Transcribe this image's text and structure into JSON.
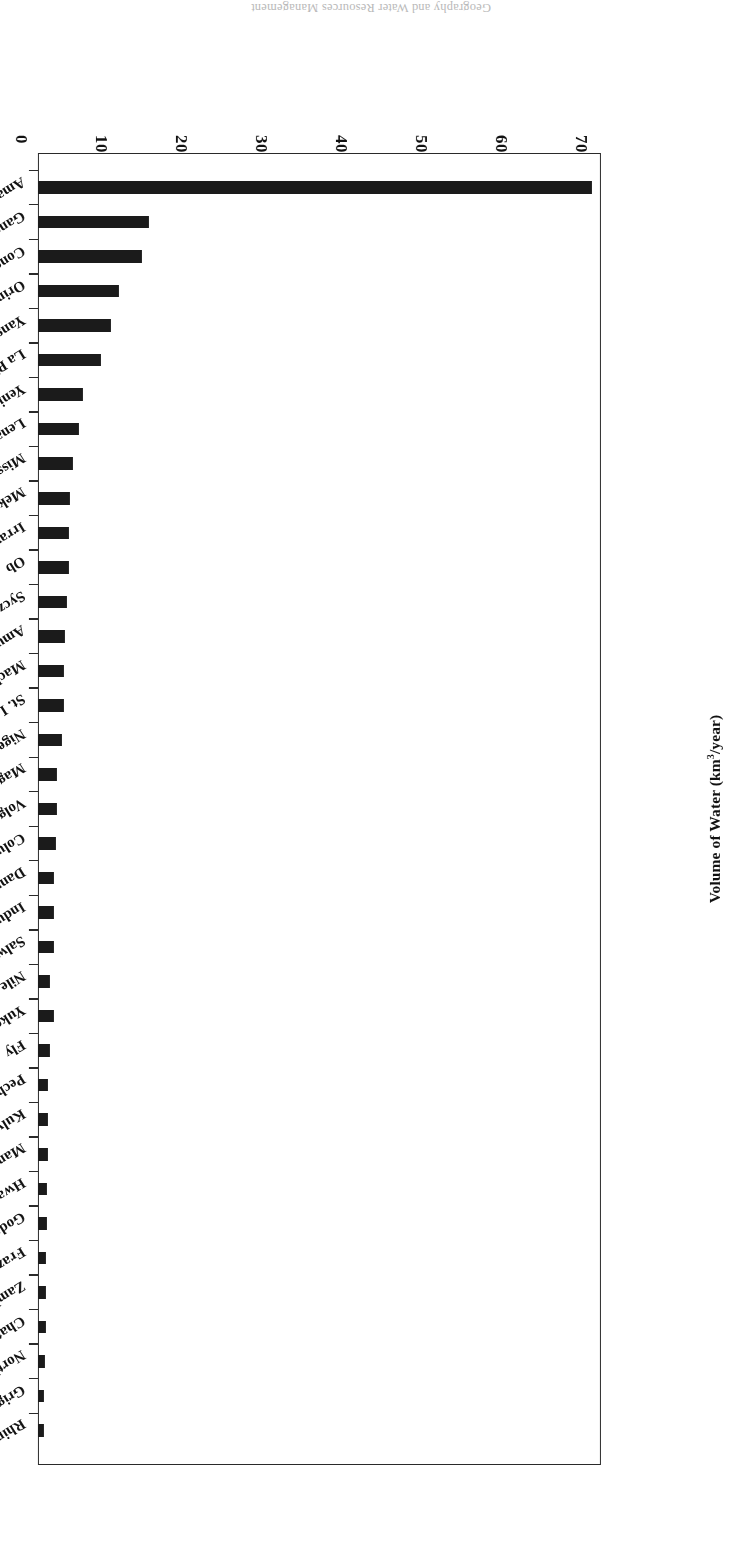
{
  "page": {
    "header_fragment": "Geography and Water Resources Management"
  },
  "chart_data": {
    "type": "bar",
    "orientation": "horizontal",
    "title": "",
    "subtitle": "",
    "xlabel": "",
    "ylabel": "Volume of Water (km3/year)",
    "ylabel_main": "Volume of Water (km",
    "ylabel_sup": "3",
    "ylabel_tail": "/year)",
    "value_axis_label": "Volume of Water (km3/year)",
    "ylim": [
      0,
      7000
    ],
    "grid": false,
    "legend": null,
    "tick_labels": [
      "0",
      "1000",
      "2000",
      "3000",
      "4000",
      "5000",
      "6000",
      "7000"
    ],
    "tick_values": [
      0,
      1000,
      2000,
      3000,
      4000,
      5000,
      6000,
      7000
    ],
    "axis_step": 1000,
    "bar_color": "#1b1b1b",
    "frame_color": "#2a2a2a",
    "categories": [
      "Amazon",
      "Ganges",
      "Congo",
      "Orinoco",
      "Yangtze",
      "La Plata",
      "Yenisey",
      "Lena",
      "Mississippi",
      "Mekong",
      "Irrawaddy",
      "Ob",
      "Syczyan",
      "Amur",
      "Mackenzie",
      "St. Lawrence",
      "Niger",
      "Magdalena",
      "Volga",
      "Columbia",
      "Danube",
      "Indus",
      "Salween",
      "Nile",
      "Yukong",
      "Fly",
      "Pechora",
      "Kulyma",
      "Mamberamo",
      "Hwang Ho",
      "Godavari",
      "Frazer",
      "Zambezi",
      "Chati-al-Arab",
      "Northern Dvina",
      "Grigalva",
      "Rhine"
    ],
    "values": [
      6930,
      1390,
      1300,
      1010,
      910,
      790,
      560,
      510,
      440,
      400,
      390,
      385,
      360,
      340,
      330,
      320,
      300,
      240,
      235,
      230,
      205,
      200,
      195,
      150,
      195,
      150,
      130,
      125,
      120,
      115,
      110,
      105,
      100,
      95,
      90,
      80,
      75
    ]
  }
}
